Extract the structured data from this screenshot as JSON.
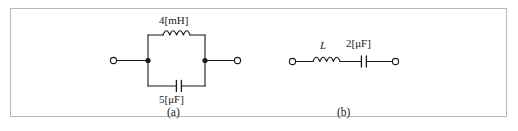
{
  "figure": {
    "border_color": "#b9b9b9",
    "line_color": "#1a1a1a",
    "background": "#ffffff",
    "width": 518,
    "height": 131
  },
  "circuit_a": {
    "caption": "(a)",
    "topology": "parallel LC",
    "inductor": {
      "label": "4[mH]",
      "value": 4,
      "unit": "mH",
      "coil_turns": 4
    },
    "capacitor": {
      "label": "5[μF]",
      "value": 5,
      "unit": "μF"
    },
    "terminals": [
      "left-open-terminal",
      "right-open-terminal"
    ],
    "nodes": [
      "left-junction-dot",
      "right-junction-dot"
    ]
  },
  "circuit_b": {
    "caption": "(b)",
    "topology": "series LC",
    "inductor": {
      "label": "L",
      "value": "L",
      "unit": "",
      "coil_turns": 4
    },
    "capacitor": {
      "label": "2[μF]",
      "value": 2,
      "unit": "μF"
    },
    "terminals": [
      "left-open-terminal",
      "right-open-terminal"
    ]
  }
}
